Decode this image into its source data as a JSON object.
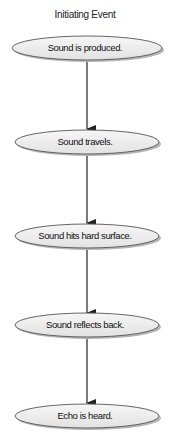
{
  "diagram": {
    "title": "Initiating Event",
    "type": "flowchart",
    "direction": "top-to-bottom",
    "colors": {
      "node_fill": "#ececec",
      "node_stroke": "#555555",
      "node_shadow": "#b5b5b5",
      "edge": "#222222",
      "text": "#111111"
    },
    "nodes": [
      {
        "id": "n1",
        "label": "Sound is produced.",
        "shape": "ellipse"
      },
      {
        "id": "n2",
        "label": "Sound travels.",
        "shape": "ellipse"
      },
      {
        "id": "n3",
        "label": "Sound hits hard surface.",
        "shape": "ellipse"
      },
      {
        "id": "n4",
        "label": "Sound reflects back.",
        "shape": "ellipse"
      },
      {
        "id": "n5",
        "label": "Echo is heard.",
        "shape": "ellipse"
      }
    ],
    "edges": [
      {
        "from": "n1",
        "to": "n2"
      },
      {
        "from": "n2",
        "to": "n3"
      },
      {
        "from": "n3",
        "to": "n4"
      },
      {
        "from": "n4",
        "to": "n5"
      }
    ]
  }
}
